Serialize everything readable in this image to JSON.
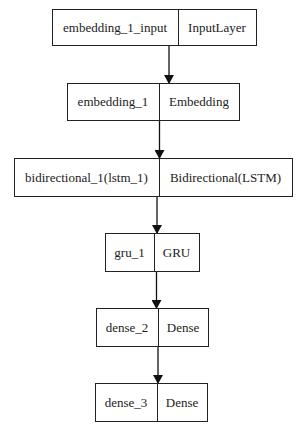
{
  "diagram": {
    "type": "keras-model-plot",
    "nodes": [
      {
        "name": "embedding_1_input",
        "class": "InputLayer"
      },
      {
        "name": "embedding_1",
        "class": "Embedding"
      },
      {
        "name": "bidirectional_1(lstm_1)",
        "class": "Bidirectional(LSTM)"
      },
      {
        "name": "gru_1",
        "class": "GRU"
      },
      {
        "name": "dense_2",
        "class": "Dense"
      },
      {
        "name": "dense_3",
        "class": "Dense"
      }
    ],
    "edges": [
      {
        "from": "embedding_1_input",
        "to": "embedding_1"
      },
      {
        "from": "embedding_1",
        "to": "bidirectional_1(lstm_1)"
      },
      {
        "from": "bidirectional_1(lstm_1)",
        "to": "gru_1"
      },
      {
        "from": "gru_1",
        "to": "dense_2"
      },
      {
        "from": "dense_2",
        "to": "dense_3"
      }
    ]
  }
}
